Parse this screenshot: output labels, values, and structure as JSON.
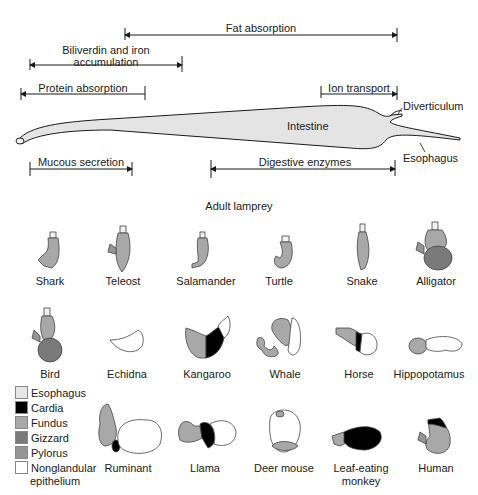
{
  "lamprey": {
    "title": "Adult lamprey",
    "organ_labels": {
      "intestine": "Intestine",
      "diverticulum": "Diverticulum",
      "esophagus": "Esophagus"
    },
    "functions": [
      {
        "label": "Fat absorption",
        "x1": 125,
        "x2": 397,
        "y": 35
      },
      {
        "label": "Biliverdin and iron accumulation",
        "line1": "Biliverdin and iron",
        "line2": "accumulation",
        "x1": 30,
        "x2": 182,
        "y": 65
      },
      {
        "label": "Protein absorption",
        "x1": 21,
        "x2": 145,
        "y": 94
      },
      {
        "label": "Ion transport",
        "x1": 321,
        "x2": 397,
        "y": 94
      },
      {
        "label": "Mucous secretion",
        "x1": 30,
        "x2": 132,
        "y": 169
      },
      {
        "label": "Digestive enzymes",
        "x1": 211,
        "x2": 395,
        "y": 169
      }
    ]
  },
  "stomachs": [
    {
      "name": "Shark",
      "row": 1,
      "x": 57
    },
    {
      "name": "Teleost",
      "row": 1,
      "x": 130
    },
    {
      "name": "Salamander",
      "row": 1,
      "x": 208
    },
    {
      "name": "Turtle",
      "row": 1,
      "x": 280
    },
    {
      "name": "Snake",
      "row": 1,
      "x": 363
    },
    {
      "name": "Alligator",
      "row": 1,
      "x": 436
    },
    {
      "name": "Bird",
      "row": 2,
      "x": 50
    },
    {
      "name": "Echidna",
      "row": 2,
      "x": 128
    },
    {
      "name": "Kangaroo",
      "row": 2,
      "x": 207
    },
    {
      "name": "Whale",
      "row": 2,
      "x": 287
    },
    {
      "name": "Horse",
      "row": 2,
      "x": 358
    },
    {
      "name": "Hippopotamus",
      "row": 2,
      "x": 429
    },
    {
      "name": "Ruminant",
      "row": 3,
      "x": 128
    },
    {
      "name": "Llama",
      "row": 3,
      "x": 209
    },
    {
      "name": "Deer mouse",
      "row": 3,
      "x": 285
    },
    {
      "name": "Leaf-eating monkey",
      "line1": "Leaf-eating",
      "line2": "monkey",
      "row": 3,
      "x": 361
    },
    {
      "name": "Human",
      "row": 3,
      "x": 436
    }
  ],
  "legend": {
    "items": [
      {
        "label": "Esophagus",
        "color": "#e6e6e6"
      },
      {
        "label": "Cardia",
        "color": "#000000"
      },
      {
        "label": "Fundus",
        "color": "#a8a8a8"
      },
      {
        "label": "Gizzard",
        "color": "#7a7a7a"
      },
      {
        "label": "Pylorus",
        "color": "#959595"
      },
      {
        "label": "Nonglandular",
        "color": "#ffffff"
      }
    ],
    "last_line": "epithelium"
  }
}
